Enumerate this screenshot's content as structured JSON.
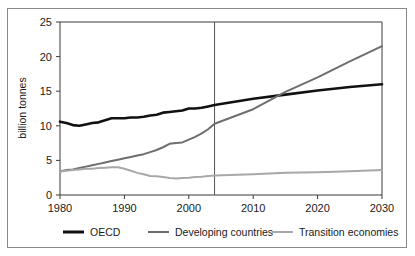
{
  "chart_data": {
    "type": "line",
    "title": "",
    "subtitle": "",
    "xlabel": "",
    "ylabel": "billion tonnes",
    "xlim": [
      1980,
      2030
    ],
    "ylim": [
      0,
      25
    ],
    "xticks": [
      1980,
      1990,
      2000,
      2010,
      2020,
      2030
    ],
    "yticks": [
      0,
      5,
      10,
      15,
      20,
      25
    ],
    "xtick_labels": [
      "1980",
      "1990",
      "2000",
      "2010",
      "2020",
      "2030"
    ],
    "ytick_labels": [
      "0",
      "5",
      "10",
      "15",
      "20",
      "25"
    ],
    "grid": false,
    "legend_position": "below",
    "annotations": [
      {
        "name": "projection-divider",
        "type": "vline",
        "x": 2004,
        "label": ""
      }
    ],
    "x": [
      1980,
      1981,
      1982,
      1983,
      1984,
      1985,
      1986,
      1987,
      1988,
      1989,
      1990,
      1991,
      1992,
      1993,
      1994,
      1995,
      1996,
      1997,
      1998,
      1999,
      2000,
      2001,
      2002,
      2003,
      2004,
      2010,
      2015,
      2020,
      2025,
      2030
    ],
    "series": [
      {
        "name": "OECD",
        "color": "#111111",
        "width": 2.6,
        "values": [
          10.6,
          10.4,
          10.1,
          10.0,
          10.2,
          10.4,
          10.5,
          10.8,
          11.1,
          11.1,
          11.1,
          11.2,
          11.2,
          11.3,
          11.5,
          11.6,
          11.9,
          12.0,
          12.1,
          12.2,
          12.5,
          12.5,
          12.6,
          12.8,
          13.0,
          13.9,
          14.5,
          15.1,
          15.6,
          16.0
        ]
      },
      {
        "name": "Developing countries",
        "color": "#6e6e6e",
        "width": 2.0,
        "values": [
          3.4,
          3.6,
          3.7,
          3.9,
          4.1,
          4.3,
          4.5,
          4.7,
          4.9,
          5.1,
          5.3,
          5.5,
          5.7,
          5.9,
          6.2,
          6.5,
          6.9,
          7.4,
          7.5,
          7.6,
          8.0,
          8.4,
          8.9,
          9.5,
          10.3,
          12.4,
          14.9,
          17.0,
          19.3,
          21.5
        ]
      },
      {
        "name": "Transition economies",
        "color": "#a8a8a8",
        "width": 2.0,
        "values": [
          3.4,
          3.5,
          3.6,
          3.7,
          3.8,
          3.8,
          3.9,
          3.95,
          4.0,
          4.0,
          3.8,
          3.5,
          3.2,
          3.0,
          2.75,
          2.7,
          2.6,
          2.45,
          2.4,
          2.45,
          2.5,
          2.6,
          2.65,
          2.75,
          2.8,
          3.0,
          3.2,
          3.3,
          3.45,
          3.6
        ]
      }
    ]
  },
  "legend": {
    "items": [
      {
        "label": "OECD",
        "color": "#111111"
      },
      {
        "label": "Developing countries",
        "color": "#6e6e6e"
      },
      {
        "label": "Transition economies",
        "color": "#a8a8a8"
      }
    ]
  },
  "axes": {
    "y_title": "billion tonnes"
  }
}
